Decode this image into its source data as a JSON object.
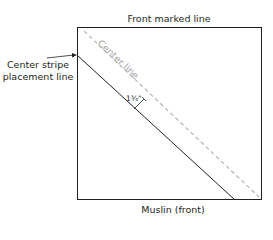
{
  "diagram": {
    "top_label": "Front marked line",
    "bottom_label": "Muslin (front)",
    "left_label_line1": "Center stripe",
    "left_label_line2": "placement line",
    "center_line_label": "Center line",
    "measurement_label": "1¾\"",
    "colors": {
      "outline": "#231f20",
      "center_line": "#b4b4b4"
    }
  }
}
